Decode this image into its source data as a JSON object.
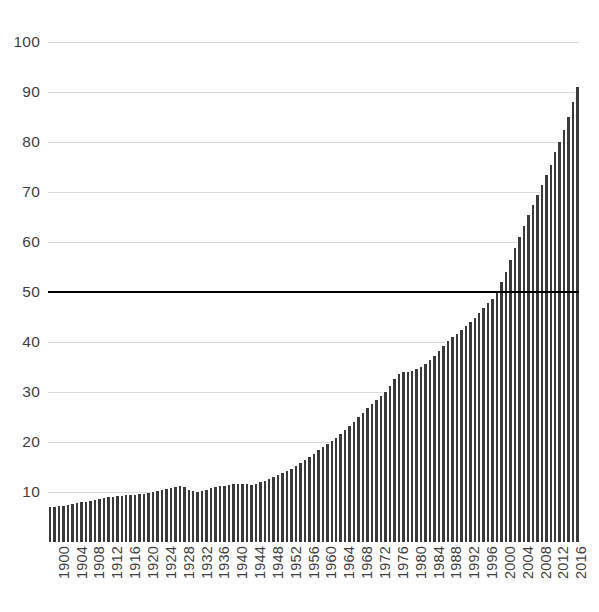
{
  "chart_data": {
    "type": "bar",
    "title": "",
    "subtitle": "",
    "xlabel": "",
    "ylabel": "",
    "xlim": [
      1900,
      2018
    ],
    "ylim": [
      0,
      100
    ],
    "grid": true,
    "legend": false,
    "y_ticks": [
      100,
      90,
      80,
      70,
      60,
      50,
      40,
      30,
      20,
      10
    ],
    "x_tick_labels": [
      "1900",
      "1904",
      "1908",
      "1912",
      "1916",
      "1920",
      "1924",
      "1928",
      "1932",
      "1936",
      "1940",
      "1944",
      "1948",
      "1952",
      "1956",
      "1960",
      "1964",
      "1968",
      "1972",
      "1976",
      "1980",
      "1984",
      "1988",
      "1992",
      "1996",
      "2000",
      "2004",
      "2008",
      "2012",
      "2016"
    ],
    "x_tick_step": 4,
    "bar_color": "#3a3a3a",
    "gridline_color": "#d9d9d9",
    "annotations": [
      {
        "name": "threshold-line",
        "type": "hline",
        "value": 50,
        "color": "#000000",
        "label": ""
      }
    ],
    "categories": [
      1900,
      1901,
      1902,
      1903,
      1904,
      1905,
      1906,
      1907,
      1908,
      1909,
      1910,
      1911,
      1912,
      1913,
      1914,
      1915,
      1916,
      1917,
      1918,
      1919,
      1920,
      1921,
      1922,
      1923,
      1924,
      1925,
      1926,
      1927,
      1928,
      1929,
      1930,
      1931,
      1932,
      1933,
      1934,
      1935,
      1936,
      1937,
      1938,
      1939,
      1940,
      1941,
      1942,
      1943,
      1944,
      1945,
      1946,
      1947,
      1948,
      1949,
      1950,
      1951,
      1952,
      1953,
      1954,
      1955,
      1956,
      1957,
      1958,
      1959,
      1960,
      1961,
      1962,
      1963,
      1964,
      1965,
      1966,
      1967,
      1968,
      1969,
      1970,
      1971,
      1972,
      1973,
      1974,
      1975,
      1976,
      1977,
      1978,
      1979,
      1980,
      1981,
      1982,
      1983,
      1984,
      1985,
      1986,
      1987,
      1988,
      1989,
      1990,
      1991,
      1992,
      1993,
      1994,
      1995,
      1996,
      1997,
      1998,
      1999,
      2000,
      2001,
      2002,
      2003,
      2004,
      2005,
      2006,
      2007,
      2008,
      2009,
      2010,
      2011,
      2012,
      2013,
      2014,
      2015,
      2016,
      2017,
      2018
    ],
    "values": [
      7.0,
      7.1,
      7.2,
      7.3,
      7.4,
      7.6,
      7.8,
      8.0,
      8.1,
      8.3,
      8.5,
      8.6,
      8.8,
      9.0,
      9.1,
      9.2,
      9.3,
      9.4,
      9.4,
      9.5,
      9.6,
      9.7,
      9.9,
      10.1,
      10.3,
      10.5,
      10.7,
      10.9,
      11.1,
      11.2,
      11.0,
      10.5,
      10.2,
      10.1,
      10.2,
      10.5,
      10.8,
      11.0,
      11.2,
      11.3,
      11.4,
      11.6,
      11.7,
      11.7,
      11.6,
      11.5,
      11.7,
      12.0,
      12.3,
      12.6,
      13.0,
      13.4,
      13.8,
      14.2,
      14.7,
      15.2,
      15.8,
      16.4,
      17.0,
      17.7,
      18.4,
      19.0,
      19.6,
      20.2,
      20.9,
      21.6,
      22.4,
      23.2,
      24.1,
      25.0,
      25.9,
      26.8,
      27.6,
      28.4,
      29.2,
      30.0,
      31.2,
      32.6,
      33.6,
      34.0,
      34.0,
      34.2,
      34.6,
      35.0,
      35.6,
      36.4,
      37.3,
      38.3,
      39.3,
      40.2,
      41.0,
      41.7,
      42.4,
      43.2,
      44.0,
      44.9,
      45.8,
      46.8,
      47.8,
      48.7,
      50.1,
      52.0,
      54.0,
      56.5,
      58.8,
      61.0,
      63.2,
      65.5,
      67.5,
      69.5,
      71.5,
      73.5,
      75.5,
      78.0,
      80.0,
      82.5,
      85.0,
      88.0,
      91.0
    ]
  }
}
